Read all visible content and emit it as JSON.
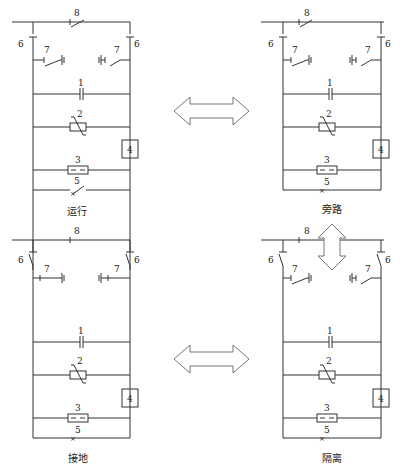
{
  "figure": {
    "panels": [
      {
        "id": "top-left",
        "caption": "运行",
        "state": "operation",
        "bypass_switch_8": "open",
        "disconnectors_6": "closed",
        "earthing_7": "open",
        "breaker_5": "open"
      },
      {
        "id": "top-right",
        "caption": "旁路",
        "state": "bypass",
        "bypass_switch_8": "open",
        "disconnectors_6": "closed",
        "earthing_7": "open",
        "breaker_5": "closed"
      },
      {
        "id": "bottom-left",
        "caption": "接地",
        "state": "grounded",
        "bypass_switch_8": "closed",
        "disconnectors_6": "open",
        "earthing_7": "closed",
        "breaker_5": "closed"
      },
      {
        "id": "bottom-right",
        "caption": "隔离",
        "state": "isolated",
        "bypass_switch_8": "closed",
        "disconnectors_6": "open",
        "earthing_7": "open",
        "breaker_5": "closed"
      }
    ],
    "labels": {
      "capacitor": "1",
      "varistor": "2",
      "spark_gap": "3",
      "damping_box": "4",
      "breaker": "5",
      "disconnector": "6",
      "earthing_switch": "7",
      "bypass_switch": "8"
    },
    "arrows": [
      {
        "from": "top-left",
        "to": "top-right",
        "type": "double-horizontal"
      },
      {
        "from": "top-right",
        "to": "bottom-right",
        "type": "double-vertical"
      },
      {
        "from": "bottom-left",
        "to": "bottom-right",
        "type": "double-horizontal"
      }
    ]
  }
}
